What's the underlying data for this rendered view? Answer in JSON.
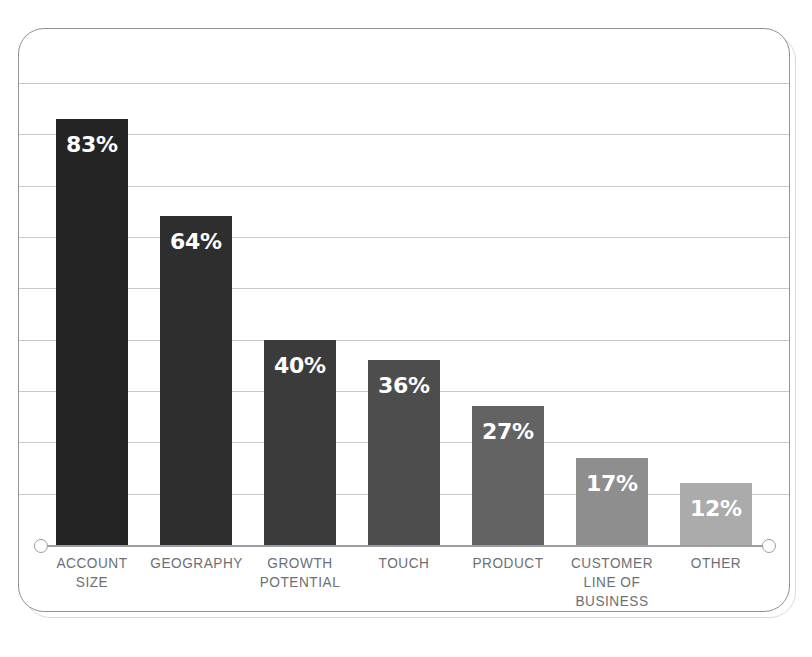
{
  "chart_data": {
    "type": "bar",
    "title": "",
    "subtitle": "",
    "xlabel": "",
    "ylabel": "",
    "ylim": [
      0,
      90
    ],
    "grid": true,
    "gridline_step": 10,
    "gridline_count": 9,
    "legend": "none",
    "orientation": "vertical",
    "value_label_position": "inside-top",
    "categories": [
      "ACCOUNT\nSIZE",
      "GEOGRAPHY",
      "GROWTH\nPOTENTIAL",
      "TOUCH",
      "PRODUCT",
      "CUSTOMER\nLINE OF\nBUSINESS",
      "OTHER"
    ],
    "values": [
      83,
      64,
      40,
      36,
      27,
      17,
      12
    ],
    "value_labels": [
      "83%",
      "64%",
      "40%",
      "36%",
      "27%",
      "17%",
      "12%"
    ],
    "bar_colors": [
      "#242424",
      "#2e2e2e",
      "#3b3b3b",
      "#4d4d4d",
      "#636363",
      "#8e8e8e",
      "#ababab"
    ]
  },
  "axis": {
    "baseline_color": "#9a9da1",
    "gridline_color": "#c7cacd",
    "cap_style": "open-circle"
  },
  "frame": {
    "border_color": "#8d9095",
    "shadow_color": "#d8dadd",
    "background": "#ffffff",
    "corner_radius": "26px"
  },
  "label_style": {
    "color": "#6d7074",
    "value_color": "#ffffff"
  }
}
